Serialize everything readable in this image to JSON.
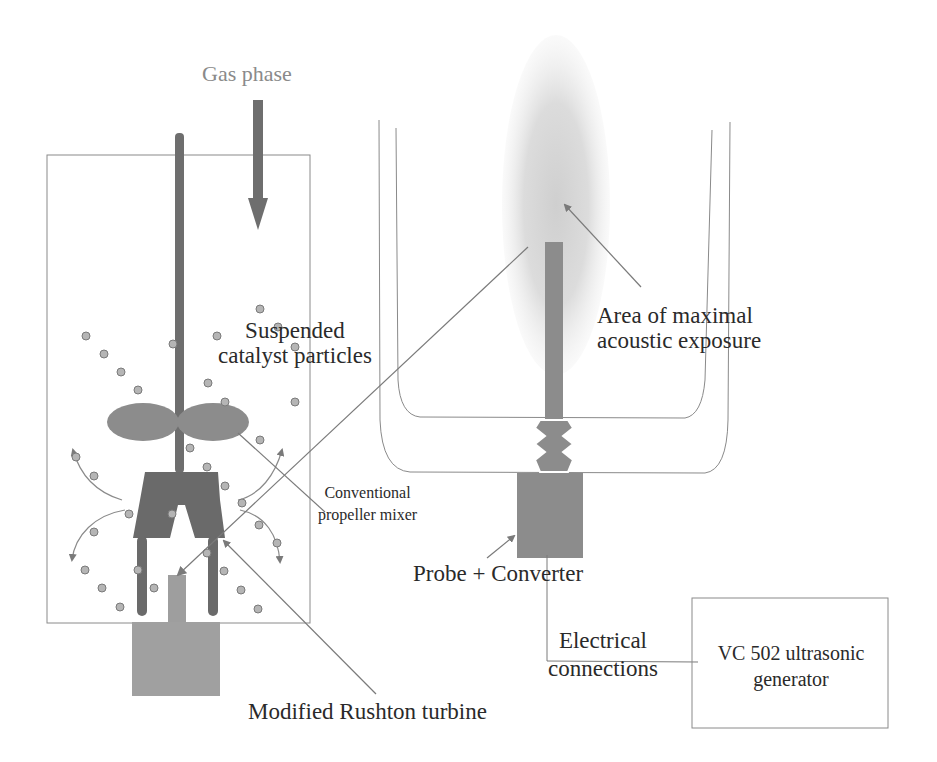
{
  "figure": {
    "type": "schematic",
    "left_apparatus": "stirred reactor with modified Rushton turbine and propeller mixer",
    "right_apparatus": "ultrasonic probe in double-walled vessel"
  },
  "labels": {
    "gas_phase": "Gas phase",
    "suspended": {
      "line1": "Suspended",
      "line2": "catalyst particles"
    },
    "area": {
      "line1": "Area of maximal",
      "line2": "acoustic exposure"
    },
    "conventional": {
      "line1": "Conventional",
      "line2": "propeller mixer"
    },
    "probe": "Probe + Converter",
    "electrical": {
      "line1": "Electrical",
      "line2": "connections"
    },
    "generator": {
      "line1": "VC 502 ultrasonic",
      "line2": "generator"
    },
    "rushton": "Modified Rushton turbine"
  },
  "colors": {
    "dark_gray": "#6e6e6e",
    "medium_gray": "#8c8c8c",
    "light_gray": "#a8a8a8",
    "cloud": "#d9d9d9",
    "line": "#7a7a7a",
    "text": "#2a2a2a"
  }
}
